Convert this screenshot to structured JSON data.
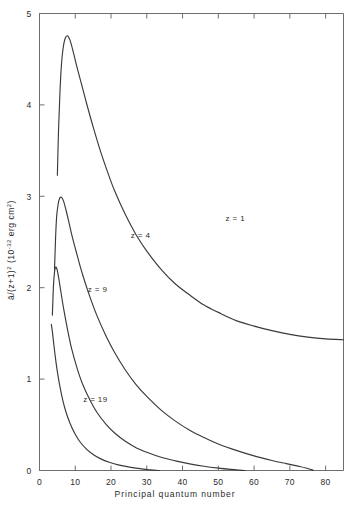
{
  "chart_data": {
    "type": "line",
    "title": "",
    "xlabel": "Principal quantum number",
    "ylabel": "ā/(z+1)² (10⁻³² erg cm²)",
    "ylabel_parts": {
      "symbol": "ā",
      "divider": "/(z+1)",
      "exponent_main": "2",
      "unit_open": "(10",
      "unit_exp": "-32",
      "unit_rest": "erg cm",
      "unit_exp2": "2",
      "unit_close": ")"
    },
    "xlim": [
      0,
      85
    ],
    "ylim": [
      0,
      5
    ],
    "xticks": [
      0,
      10,
      20,
      30,
      40,
      50,
      60,
      70,
      80
    ],
    "xtick_labels": [
      "0",
      "10",
      "20",
      "30",
      "40",
      "50",
      "60",
      "70",
      "80"
    ],
    "yticks": [
      0,
      1,
      2,
      3,
      4,
      5
    ],
    "ytick_labels": [
      "0",
      "1",
      "2",
      "3",
      "4",
      "5"
    ],
    "grid": false,
    "legend": "inline-curve-labels",
    "series": [
      {
        "name": "z = 1",
        "label": "z = 1",
        "label_x": 52,
        "label_y": 2.73,
        "points": [
          [
            5.0,
            3.23
          ],
          [
            5.3,
            3.7
          ],
          [
            5.7,
            4.12
          ],
          [
            6.1,
            4.42
          ],
          [
            6.6,
            4.62
          ],
          [
            7.2,
            4.73
          ],
          [
            7.9,
            4.755
          ],
          [
            8.6,
            4.7
          ],
          [
            9.5,
            4.57
          ],
          [
            10.5,
            4.41
          ],
          [
            11.8,
            4.22
          ],
          [
            13.0,
            4.04
          ],
          [
            15.0,
            3.76
          ],
          [
            17.0,
            3.5
          ],
          [
            19.0,
            3.27
          ],
          [
            21.0,
            3.06
          ],
          [
            24.0,
            2.8
          ],
          [
            27.0,
            2.58
          ],
          [
            30.0,
            2.4
          ],
          [
            34.0,
            2.2
          ],
          [
            38.0,
            2.04
          ],
          [
            42.0,
            1.92
          ],
          [
            46.0,
            1.81
          ],
          [
            50.0,
            1.73
          ],
          [
            55.0,
            1.64
          ],
          [
            60.0,
            1.58
          ],
          [
            65.0,
            1.53
          ],
          [
            70.0,
            1.49
          ],
          [
            75.0,
            1.46
          ],
          [
            80.0,
            1.44
          ],
          [
            85.0,
            1.43
          ]
        ]
      },
      {
        "name": "z = 4",
        "label": "z = 4",
        "label_x": 25.5,
        "label_y": 2.54,
        "points": [
          [
            4.2,
            2.2
          ],
          [
            4.5,
            2.55
          ],
          [
            4.8,
            2.78
          ],
          [
            5.2,
            2.91
          ],
          [
            5.6,
            2.975
          ],
          [
            6.1,
            2.99
          ],
          [
            6.7,
            2.95
          ],
          [
            7.4,
            2.85
          ],
          [
            8.2,
            2.72
          ],
          [
            9.2,
            2.55
          ],
          [
            10.5,
            2.36
          ],
          [
            12.0,
            2.15
          ],
          [
            14.0,
            1.91
          ],
          [
            16.0,
            1.7
          ],
          [
            18.5,
            1.48
          ],
          [
            21.0,
            1.29
          ],
          [
            24.0,
            1.1
          ],
          [
            27.0,
            0.94
          ],
          [
            30.0,
            0.81
          ],
          [
            34.0,
            0.66
          ],
          [
            38.0,
            0.54
          ],
          [
            42.0,
            0.44
          ],
          [
            46.0,
            0.36
          ],
          [
            50.0,
            0.29
          ],
          [
            55.0,
            0.22
          ],
          [
            60.0,
            0.16
          ],
          [
            65.0,
            0.11
          ],
          [
            69.0,
            0.075
          ],
          [
            72.0,
            0.05
          ],
          [
            74.5,
            0.028
          ],
          [
            76.0,
            0.01
          ],
          [
            76.6,
            0.0
          ]
        ]
      },
      {
        "name": "z = 9",
        "label": "z = 9",
        "label_x": 13.5,
        "label_y": 1.95,
        "points": [
          [
            3.6,
            1.7
          ],
          [
            3.9,
            2.02
          ],
          [
            4.2,
            2.17
          ],
          [
            4.5,
            2.225
          ],
          [
            4.9,
            2.2
          ],
          [
            5.4,
            2.1
          ],
          [
            6.0,
            1.95
          ],
          [
            6.8,
            1.76
          ],
          [
            7.8,
            1.55
          ],
          [
            9.0,
            1.33
          ],
          [
            10.5,
            1.12
          ],
          [
            12.0,
            0.95
          ],
          [
            14.0,
            0.78
          ],
          [
            16.0,
            0.64
          ],
          [
            18.5,
            0.51
          ],
          [
            21.0,
            0.41
          ],
          [
            24.0,
            0.32
          ],
          [
            27.0,
            0.25
          ],
          [
            30.0,
            0.2
          ],
          [
            34.0,
            0.145
          ],
          [
            38.0,
            0.105
          ],
          [
            42.0,
            0.072
          ],
          [
            46.0,
            0.046
          ],
          [
            50.0,
            0.026
          ],
          [
            53.5,
            0.012
          ],
          [
            56.0,
            0.004
          ],
          [
            57.5,
            0.0
          ]
        ]
      },
      {
        "name": "z = 19",
        "label": "z = 19",
        "label_x": 12.2,
        "label_y": 0.745,
        "points": [
          [
            3.3,
            1.6
          ],
          [
            3.6,
            1.52
          ],
          [
            4.0,
            1.38
          ],
          [
            4.5,
            1.22
          ],
          [
            5.0,
            1.08
          ],
          [
            5.7,
            0.92
          ],
          [
            6.5,
            0.77
          ],
          [
            7.4,
            0.64
          ],
          [
            8.5,
            0.52
          ],
          [
            9.8,
            0.41
          ],
          [
            11.2,
            0.32
          ],
          [
            13.0,
            0.24
          ],
          [
            15.0,
            0.175
          ],
          [
            17.0,
            0.13
          ],
          [
            19.5,
            0.09
          ],
          [
            22.0,
            0.062
          ],
          [
            24.5,
            0.042
          ],
          [
            27.0,
            0.026
          ],
          [
            29.0,
            0.015
          ],
          [
            31.0,
            0.007
          ],
          [
            32.5,
            0.002
          ],
          [
            33.5,
            0.0
          ]
        ]
      }
    ]
  }
}
